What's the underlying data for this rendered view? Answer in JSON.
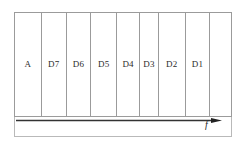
{
  "figure": {
    "kind": "frequency-band-allocation-diagram",
    "axis": {
      "label": "f",
      "direction": "left-to-right",
      "arrow_icon": "right-arrow-icon"
    },
    "colors": {
      "frame_stroke": "#b9b9b9",
      "cell_stroke": "#9b9b9b",
      "text": "#2b2b2b",
      "axis_stroke": "#333333",
      "background": "#ffffff"
    },
    "bands": [
      {
        "label": "A",
        "width_pct": 12.4
      },
      {
        "label": "D7",
        "width_pct": 11.5
      },
      {
        "label": "D6",
        "width_pct": 11.5
      },
      {
        "label": "D5",
        "width_pct": 11.9
      },
      {
        "label": "D4",
        "width_pct": 10.6
      },
      {
        "label": "D3",
        "width_pct": 8.7
      },
      {
        "label": "D2",
        "width_pct": 12.4
      },
      {
        "label": "D1",
        "width_pct": 11.5
      },
      {
        "label": "",
        "width_pct": 9.5
      }
    ]
  }
}
